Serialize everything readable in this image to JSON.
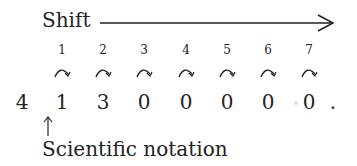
{
  "diagram": {
    "shift_label": "Shift",
    "shift_arrow_icon": "right-arrow",
    "step_numbers": [
      "1",
      "2",
      "3",
      "4",
      "5",
      "6",
      "7"
    ],
    "step_icon": "curved-arrow-right-icon",
    "digits": [
      "4",
      "1",
      "3",
      "0",
      "0",
      "0",
      "0",
      "0",
      "."
    ],
    "pointer_icon": "up-arrow",
    "pointer_label": "Scientific notation",
    "colors": {
      "ink": "#222222",
      "background": "#ffffff"
    }
  }
}
